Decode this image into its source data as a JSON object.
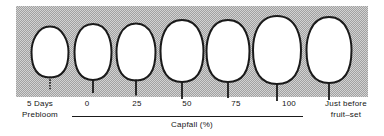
{
  "figure": {
    "name": "grape-berry-development-stages",
    "panel_color": "#d2d2d2",
    "outline_color": "#1a1a1a",
    "berry_fill": "#ffffff"
  },
  "axis": {
    "caption": "Capfall (%)",
    "line_color": "#1a1a1a",
    "ticks": [
      {
        "label": "0",
        "x": 87
      },
      {
        "label": "25",
        "x": 137
      },
      {
        "label": "50",
        "x": 187
      },
      {
        "label": "75",
        "x": 236
      },
      {
        "label": "100",
        "x": 289
      }
    ]
  },
  "end_labels": {
    "left": {
      "line1": "5  Days",
      "line2": "Prebloom"
    },
    "right": {
      "line1": "Just  before",
      "line2": "fruit–set"
    }
  },
  "chart_data": {
    "type": "diagram",
    "title": "",
    "xlabel": "Capfall (%)",
    "ylabel": "",
    "categories": [
      "5 Days Prebloom",
      "0",
      "25",
      "50",
      "75",
      "100",
      "Just before fruit-set"
    ],
    "series": [
      {
        "name": "berry outline",
        "berries": [
          {
            "stage": "5 Days Prebloom",
            "cx": 50.0,
            "cy": 52.0,
            "rx": 18.5,
            "ry": 25.5,
            "shape": "egg",
            "top_narrow": 0.7,
            "stem_len": 13,
            "stem_style": "dotted"
          },
          {
            "stage": "0",
            "cx": 93.0,
            "cy": 52.0,
            "rx": 18.5,
            "ry": 28.0,
            "shape": "oval",
            "top_narrow": 0.88,
            "stem_len": 13,
            "stem_style": "solid"
          },
          {
            "stage": "25",
            "cx": 136.0,
            "cy": 52.0,
            "rx": 19.5,
            "ry": 28.5,
            "shape": "oval",
            "top_narrow": 0.86,
            "stem_len": 15,
            "stem_style": "solid"
          },
          {
            "stage": "50",
            "cx": 182.0,
            "cy": 51.0,
            "rx": 21.5,
            "ry": 31.0,
            "shape": "oval",
            "top_narrow": 0.87,
            "stem_len": 17,
            "stem_style": "solid"
          },
          {
            "stage": "75",
            "cx": 228.0,
            "cy": 51.0,
            "rx": 21.5,
            "ry": 31.0,
            "shape": "oval",
            "top_narrow": 0.88,
            "stem_len": 16,
            "stem_style": "solid"
          },
          {
            "stage": "100",
            "cx": 277.0,
            "cy": 50.0,
            "rx": 24.0,
            "ry": 34.0,
            "shape": "oval",
            "top_narrow": 0.89,
            "stem_len": 17,
            "stem_style": "solid"
          },
          {
            "stage": "Just before fruit-set",
            "cx": 329.0,
            "cy": 50.0,
            "rx": 22.5,
            "ry": 33.0,
            "shape": "oval",
            "top_narrow": 0.87,
            "stem_len": 17,
            "stem_style": "solid"
          }
        ]
      }
    ],
    "legend": [],
    "grid": false
  }
}
